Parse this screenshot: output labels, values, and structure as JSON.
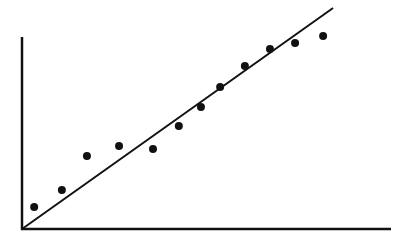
{
  "chart_data": {
    "type": "scatter",
    "title": "",
    "xlabel": "",
    "ylabel": "",
    "xlim": [
      0,
      100
    ],
    "ylim": [
      0,
      100
    ],
    "grid": false,
    "legend": null,
    "ticks": {
      "x": [],
      "y": []
    },
    "series": [
      {
        "name": "observations",
        "marker": "filled-circle",
        "color": "#111111",
        "points": [
          {
            "x": 3.3,
            "y": 11.5
          },
          {
            "x": 10.8,
            "y": 20.3
          },
          {
            "x": 17.6,
            "y": 38.0
          },
          {
            "x": 26.3,
            "y": 43.2
          },
          {
            "x": 35.5,
            "y": 41.7
          },
          {
            "x": 42.5,
            "y": 53.6
          },
          {
            "x": 48.5,
            "y": 63.5
          },
          {
            "x": 53.7,
            "y": 74.0
          },
          {
            "x": 60.4,
            "y": 84.9
          },
          {
            "x": 67.2,
            "y": 93.8
          },
          {
            "x": 74.0,
            "y": 96.9
          },
          {
            "x": 81.6,
            "y": 100.5
          }
        ]
      }
    ],
    "trend_line": {
      "name": "linear-fit",
      "color": "#111111",
      "from": {
        "x": 0,
        "y": 0
      },
      "to": {
        "x": 84.3,
        "y": 115.1
      }
    },
    "annotations": []
  },
  "colors": {
    "background": "#ffffff",
    "ink": "#111111"
  }
}
